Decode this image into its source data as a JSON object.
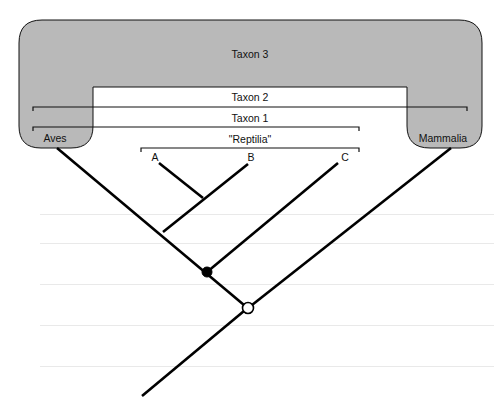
{
  "diagram": {
    "type": "cladogram",
    "colors": {
      "group_fill": "#b9b9b9",
      "line": "#000000",
      "background": "#ffffff",
      "filled_node": "#000000",
      "open_node": "#ffffff"
    },
    "groups": {
      "taxon3": "Taxon 3",
      "taxon2": "Taxon 2",
      "taxon1": "Taxon 1",
      "reptilia": "\"Reptilia\""
    },
    "leaves": {
      "aves": "Aves",
      "mammalia": "Mammalia",
      "a": "A",
      "b": "B",
      "c": "C"
    },
    "nodes": [
      {
        "name": "filled-node",
        "style": "filled"
      },
      {
        "name": "open-node",
        "style": "open"
      }
    ]
  }
}
